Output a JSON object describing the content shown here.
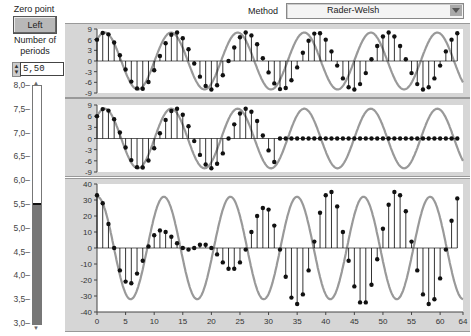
{
  "controls": {
    "zero_point_label": "Zero point",
    "zero_point_button": "Left",
    "periods_label_line1": "Number of",
    "periods_label_line2": "periods",
    "periods_value": "5,50",
    "slider": {
      "min": 3.0,
      "max": 8.0,
      "value": 5.5,
      "ticks": [
        "8,0",
        "7,5",
        "7,0",
        "6,5",
        "6,0",
        "5,5",
        "5,0",
        "4,5",
        "4,0",
        "3,5",
        "3,0"
      ]
    },
    "method_label": "Method",
    "method_value": "Rader-Welsh"
  },
  "colors": {
    "panel_bg": "#d6d6d6",
    "plot_bg": "#ffffff",
    "curve": "#999999",
    "stem": "#000000",
    "slider_fill": "#777777"
  },
  "chart_data": [
    {
      "type": "line",
      "title": "Input signal (stem + continuous)",
      "ylim": [
        -9,
        9
      ],
      "yticks": [
        "9",
        "6",
        "3",
        "0",
        "-3",
        "-6",
        "-9"
      ],
      "x": "n = 0..63",
      "continuous": {
        "amplitude": 8,
        "periods": 5.5,
        "samples": 64,
        "phase": 0.85
      },
      "values": [
        6.0,
        7.9,
        7.5,
        5.2,
        1.6,
        -2.4,
        -5.8,
        -7.7,
        -7.8,
        -5.9,
        -2.6,
        1.4,
        5.0,
        7.4,
        8.0,
        6.4,
        3.3,
        -0.7,
        -4.4,
        -7.0,
        -8.0,
        -6.8,
        -4.0,
        0.0,
        3.8,
        6.7,
        8.0,
        7.2,
        4.7,
        0.8,
        -3.2,
        -6.3,
        -7.9,
        -7.6,
        -5.4,
        -1.8,
        2.3,
        5.7,
        7.7,
        7.8,
        6.0,
        2.7,
        -1.3,
        -4.9,
        -7.4,
        -8.0,
        -6.5,
        -3.4,
        0.5,
        4.2,
        6.9,
        8.0,
        6.9,
        4.2,
        0.5,
        -3.4,
        -6.5,
        -8.0,
        -7.4,
        -4.9,
        -1.3,
        2.7,
        6.0,
        7.8
      ]
    },
    {
      "type": "line",
      "title": "Half-zeroed signal",
      "ylim": [
        -9,
        9
      ],
      "yticks": [
        "9",
        "6",
        "3",
        "0",
        "-3",
        "-6",
        "-9"
      ],
      "values": [
        6.0,
        7.9,
        7.5,
        5.2,
        1.6,
        -2.4,
        -5.8,
        -7.7,
        -7.8,
        -5.9,
        -2.6,
        1.4,
        5.0,
        7.4,
        8.0,
        6.4,
        3.3,
        -0.7,
        -4.4,
        -7.0,
        -8.0,
        -6.8,
        -4.0,
        0.0,
        3.8,
        6.7,
        8.0,
        7.2,
        4.7,
        0.8,
        -3.2,
        -6.3,
        0,
        0,
        0,
        0,
        0,
        0,
        0,
        0,
        0,
        0,
        0,
        0,
        0,
        0,
        0,
        0,
        0,
        0,
        0,
        0,
        0,
        0,
        0,
        0,
        0,
        0,
        0,
        0,
        0,
        0,
        0,
        0
      ]
    },
    {
      "type": "line",
      "title": "Result",
      "ylim": [
        -40,
        40
      ],
      "yticks": [
        "40",
        "30",
        "20",
        "10",
        "0",
        "-10",
        "-20",
        "-30",
        "-40"
      ],
      "xticks": [
        "0",
        "5",
        "10",
        "15",
        "20",
        "25",
        "30",
        "35",
        "40",
        "45",
        "50",
        "55",
        "60",
        "64"
      ],
      "continuous": {
        "amplitude": 32,
        "periods": 5.5,
        "samples": 64,
        "peak_at": 11.7
      },
      "values": [
        33,
        28,
        15,
        0,
        -14,
        -21,
        -22,
        -16,
        -8,
        1,
        8,
        11,
        10,
        7,
        3,
        0,
        -1,
        0,
        2,
        2,
        0,
        -4,
        -9,
        -13,
        -13,
        -9,
        -1,
        10,
        20,
        25,
        24,
        14,
        -1,
        -18,
        -31,
        -35,
        -29,
        -14,
        4,
        22,
        33,
        35,
        26,
        10,
        -8,
        -24,
        -34,
        -34,
        -23,
        -7,
        12,
        27,
        35,
        33,
        23,
        4,
        -14,
        -29,
        -35,
        -32,
        -19,
        -1,
        17,
        31
      ]
    }
  ]
}
